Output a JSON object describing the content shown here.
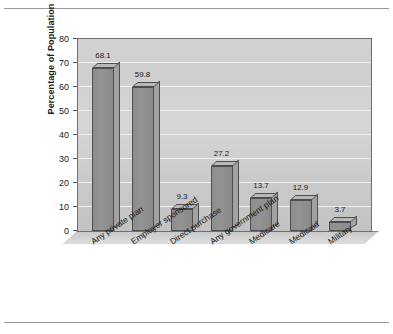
{
  "chart_data": {
    "type": "bar",
    "title": "",
    "subtitle": "",
    "xlabel": "",
    "ylabel": "Percentage of Population",
    "ylim": [
      0,
      80
    ],
    "ytick_step": 10,
    "yticks": [
      "80",
      "70",
      "60",
      "50",
      "40",
      "30",
      "20",
      "10",
      "0"
    ],
    "grid": true,
    "legend": "none",
    "three_d": true,
    "categories": [
      "Any private plan",
      "Employer sponsored",
      "Direct purchase",
      "Any government plan",
      "Medicare",
      "Medicaid",
      "Military"
    ],
    "values": [
      68.1,
      59.8,
      9.3,
      27.2,
      13.7,
      12.9,
      3.7
    ],
    "data_labels": [
      "68.1",
      "59.8",
      "9.3",
      "27.2",
      "13.7",
      "12.9",
      "3.7"
    ],
    "colors": {
      "bar_front": "#8d8d8d",
      "bar_top": "#b8b8b8",
      "bar_side": "#a2a2a2",
      "bar_edge": "#4e4e4e",
      "plot_background": "#d2d2d2",
      "gridline": "#f2f2f2",
      "axis": "#6f6f6f",
      "text": "#1a1a1a",
      "page_rule": "#9a9a9a"
    }
  }
}
